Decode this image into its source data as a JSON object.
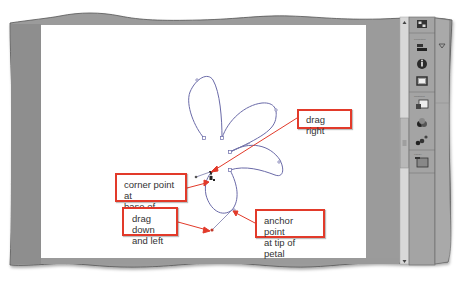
{
  "canvas": {
    "background": "#ffffff",
    "path_color": "#6a6aa8",
    "callout_border_color": "#e23a2a",
    "arrow_color": "#e23a2a"
  },
  "callouts": [
    {
      "id": "drag-right",
      "text": "drag right"
    },
    {
      "id": "corner-point",
      "line1": "corner point at",
      "line2": "base of petal"
    },
    {
      "id": "drag-down-left",
      "line1": "drag down",
      "line2": "and left"
    },
    {
      "id": "anchor-point",
      "line1": "anchor point",
      "line2": "at tip of petal"
    }
  ],
  "right_panel": {
    "groups": [
      {
        "label": "",
        "icons": [
          "panel-layout-icon"
        ]
      },
      {
        "label": "Properties",
        "icons": [
          "align-icon",
          "info-icon",
          "transform-icon"
        ]
      },
      {
        "label": "Swatches",
        "icons": [
          "color-swatch-icon",
          "color-mixer-icon",
          "components-icon"
        ]
      },
      {
        "label": "Library",
        "icons": [
          "library-icon"
        ]
      }
    ],
    "collapsed_panel_icon": "panel-expand-triangle-icon"
  },
  "scrollbar": {
    "orientation": "vertical",
    "thumb_grip": "≡"
  }
}
